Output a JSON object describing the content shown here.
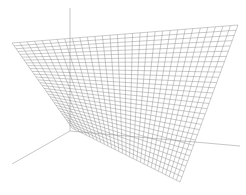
{
  "figure": {
    "caption": "",
    "colors": {
      "background": "#ffffff",
      "axis": "#b8b8b8",
      "mesh": "#8a8a8a"
    },
    "axes": {
      "origin": [
        70,
        131
      ],
      "z_end": [
        70,
        8
      ],
      "x_end": [
        12,
        164
      ],
      "y_end": [
        240,
        146
      ]
    },
    "surface": {
      "type": "hyperbolic-paraboloid",
      "corners": {
        "left_top": [
          12,
          43
        ],
        "right_top": [
          238,
          25
        ],
        "front_bottom": [
          180,
          182
        ],
        "back_low": [
          72,
          128
        ]
      },
      "grid_lines": 30
    }
  }
}
